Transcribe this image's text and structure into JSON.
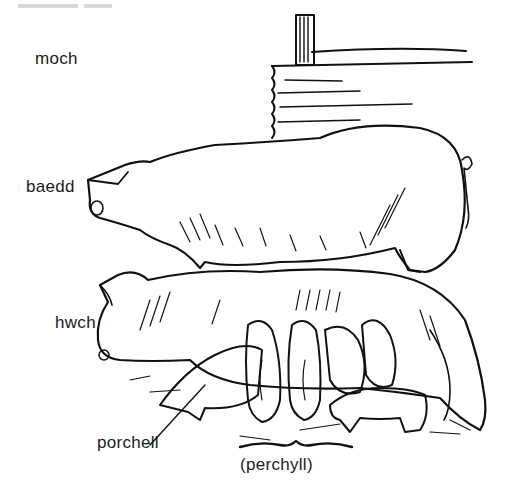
{
  "header": {
    "cropped_text": "ddod ... y"
  },
  "illustration": {
    "subject": "pigs on a farm: boar, sow suckling piglets, beside a wooden fence",
    "ink_color": "#111111",
    "paper_color": "#ffffff"
  },
  "labels": {
    "moch": "moch",
    "baedd": "baedd",
    "hwch": "hwch",
    "porchell": "porchell",
    "perchyll": "(perchyll)"
  }
}
